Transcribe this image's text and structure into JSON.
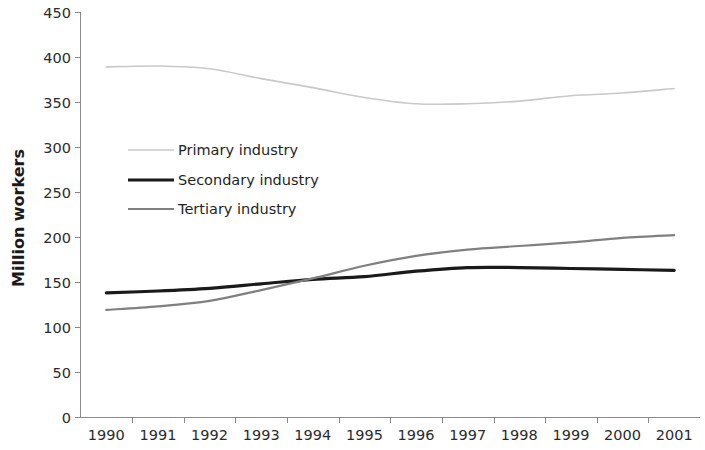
{
  "chart_data": {
    "type": "line",
    "title": "",
    "xlabel": "",
    "ylabel": "Million workers",
    "categories": [
      "1990",
      "1991",
      "1992",
      "1993",
      "1994",
      "1995",
      "1996",
      "1997",
      "1998",
      "1999",
      "2000",
      "2001"
    ],
    "ylim": [
      0,
      450
    ],
    "yticks": [
      0,
      50,
      100,
      150,
      200,
      250,
      300,
      350,
      400,
      450
    ],
    "ytick_labels": [
      "0",
      "50",
      "100",
      "150",
      "200",
      "250",
      "300",
      "350",
      "400",
      "450"
    ],
    "grid": false,
    "legend_position": "inside-upper-left",
    "series": [
      {
        "name": "Primary industry",
        "color": "#c9c9c9",
        "width": 1.6,
        "values": [
          389,
          390,
          387,
          376,
          366,
          355,
          348,
          348,
          351,
          357,
          360,
          365
        ]
      },
      {
        "name": "Secondary industry",
        "color": "#1a1a1a",
        "width": 3.2,
        "values": [
          138,
          140,
          143,
          148,
          153,
          156,
          162,
          166,
          166,
          165,
          164,
          163
        ]
      },
      {
        "name": "Tertiary industry",
        "color": "#808080",
        "width": 2.2,
        "values": [
          119,
          123,
          129,
          141,
          154,
          168,
          179,
          186,
          190,
          194,
          199,
          202
        ]
      }
    ]
  },
  "axis": {
    "y_title": "Million workers"
  },
  "legend": {
    "entries": [
      {
        "label": "Primary industry"
      },
      {
        "label": "Secondary industry"
      },
      {
        "label": "Tertiary industry"
      }
    ]
  },
  "colors": {
    "axis": "#8a8a8a",
    "text": "#2b2b2b",
    "background": "#ffffff"
  }
}
